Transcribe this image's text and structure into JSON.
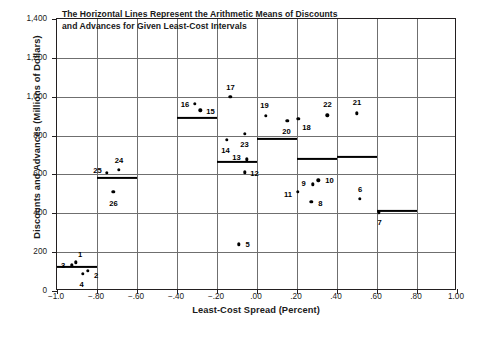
{
  "note": {
    "line1": "The Horizontal Lines Represent the Arithmetic Means of Discounts",
    "line2": "and Advances for Given Least-Cost Intervals"
  },
  "axes": {
    "ytitle": "Discounts and Advances (Millions of Dollars)",
    "xtitle": "Least-Cost Spread (Percent)",
    "yticks": [
      "0",
      "200",
      "400",
      "600",
      "800",
      "1,000",
      "1,200",
      "1,400"
    ],
    "xticks": [
      "−1.0",
      "−.80",
      "−.60",
      "−.40",
      "−.20",
      ".00",
      ".20",
      ".40",
      ".60",
      ".80",
      "1.00"
    ]
  },
  "chart_data": {
    "type": "scatter",
    "title": "The Horizontal Lines Represent the Arithmetic Means of Discounts and Advances for Given Least-Cost Intervals",
    "xlabel": "Least-Cost Spread (Percent)",
    "ylabel": "Discounts and Advances (Millions of Dollars)",
    "xlim": [
      -1.0,
      1.0
    ],
    "ylim": [
      0,
      1400
    ],
    "xtick_values": [
      -1.0,
      -0.8,
      -0.6,
      -0.4,
      -0.2,
      0.0,
      0.2,
      0.4,
      0.6,
      0.8,
      1.0
    ],
    "ytick_values": [
      0,
      200,
      400,
      600,
      800,
      1000,
      1200,
      1400
    ],
    "grid": true,
    "legend": "none",
    "points": [
      {
        "label": "1",
        "x": -0.905,
        "y": 148,
        "lab_dx": 4,
        "lab_dy": -8
      },
      {
        "label": "2",
        "x": -0.845,
        "y": 105,
        "lab_dx": 8,
        "lab_dy": 4
      },
      {
        "label": "3",
        "x": -0.925,
        "y": 133,
        "lab_dx": -9,
        "lab_dy": 0
      },
      {
        "label": "4",
        "x": -0.872,
        "y": 88,
        "lab_dx": -1,
        "lab_dy": 10
      },
      {
        "label": "5",
        "x": -0.092,
        "y": 240,
        "lab_dx": 9,
        "lab_dy": 0
      },
      {
        "label": "6",
        "x": 0.515,
        "y": 475,
        "lab_dx": 0,
        "lab_dy": -10
      },
      {
        "label": "7",
        "x": 0.608,
        "y": 405,
        "lab_dx": 1,
        "lab_dy": 10
      },
      {
        "label": "8",
        "x": 0.272,
        "y": 460,
        "lab_dx": 9,
        "lab_dy": 1
      },
      {
        "label": "9",
        "x": 0.278,
        "y": 550,
        "lab_dx": -9,
        "lab_dy": -1
      },
      {
        "label": "10",
        "x": 0.307,
        "y": 570,
        "lab_dx": 11,
        "lab_dy": 0
      },
      {
        "label": "11",
        "x": 0.205,
        "y": 512,
        "lab_dx": -10,
        "lab_dy": 2
      },
      {
        "label": "12",
        "x": -0.062,
        "y": 610,
        "lab_dx": 10,
        "lab_dy": 1
      },
      {
        "label": "13",
        "x": -0.052,
        "y": 678,
        "lab_dx": -10,
        "lab_dy": -2
      },
      {
        "label": "14",
        "x": -0.152,
        "y": 778,
        "lab_dx": -1,
        "lab_dy": 10
      },
      {
        "label": "15",
        "x": -0.283,
        "y": 930,
        "lab_dx": 10,
        "lab_dy": 1
      },
      {
        "label": "16",
        "x": -0.31,
        "y": 965,
        "lab_dx": -10,
        "lab_dy": 0
      },
      {
        "label": "17",
        "x": -0.133,
        "y": 1000,
        "lab_dx": 0,
        "lab_dy": -10
      },
      {
        "label": "18",
        "x": 0.207,
        "y": 885,
        "lab_dx": 8,
        "lab_dy": 8
      },
      {
        "label": "19",
        "x": 0.043,
        "y": 903,
        "lab_dx": -1,
        "lab_dy": -11
      },
      {
        "label": "20",
        "x": 0.152,
        "y": 877,
        "lab_dx": -1,
        "lab_dy": 10
      },
      {
        "label": "21",
        "x": 0.5,
        "y": 915,
        "lab_dx": 0,
        "lab_dy": -11
      },
      {
        "label": "22",
        "x": 0.352,
        "y": 905,
        "lab_dx": 0,
        "lab_dy": -11
      },
      {
        "label": "23",
        "x": -0.062,
        "y": 810,
        "lab_dx": 0,
        "lab_dy": 10
      },
      {
        "label": "24",
        "x": -0.69,
        "y": 625,
        "lab_dx": 0,
        "lab_dy": -10
      },
      {
        "label": "25",
        "x": -0.752,
        "y": 607,
        "lab_dx": -9,
        "lab_dy": -3
      },
      {
        "label": "26",
        "x": -0.718,
        "y": 510,
        "lab_dx": 0,
        "lab_dy": 11
      }
    ],
    "means": [
      {
        "x0": -1.0,
        "x1": -0.8,
        "value": 122
      },
      {
        "x0": -0.8,
        "x1": -0.6,
        "value": 583
      },
      {
        "x0": -0.4,
        "x1": -0.2,
        "value": 890
      },
      {
        "x0": -0.2,
        "x1": 0.0,
        "value": 665
      },
      {
        "x0": 0.0,
        "x1": 0.2,
        "value": 782
      },
      {
        "x0": 0.2,
        "x1": 0.4,
        "value": 680
      },
      {
        "x0": 0.4,
        "x1": 0.6,
        "value": 690
      },
      {
        "x0": 0.6,
        "x1": 0.8,
        "value": 412
      }
    ]
  }
}
